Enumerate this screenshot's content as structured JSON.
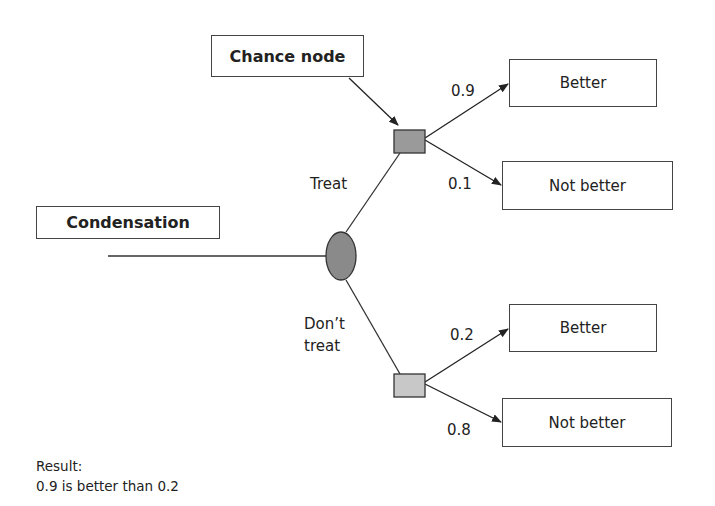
{
  "diagram": {
    "type": "decision-tree",
    "callouts": {
      "chance_node": "Chance node",
      "decision": "Condensation"
    },
    "branches": [
      {
        "label": "Treat",
        "outcomes": [
          {
            "probability": "0.9",
            "label": "Better"
          },
          {
            "probability": "0.1",
            "label": "Not better"
          }
        ]
      },
      {
        "label": "Don’t\ntreat",
        "outcomes": [
          {
            "probability": "0.2",
            "label": "Better"
          },
          {
            "probability": "0.8",
            "label": "Not better"
          }
        ]
      }
    ],
    "result": {
      "heading": "Result:",
      "text": "0.9 is better than 0.2"
    },
    "colors": {
      "decision_node": "#8a8a8a",
      "chance_node_top": "#9a9a9a",
      "chance_node_bottom": "#c8c8c8",
      "line": "#333333"
    }
  }
}
